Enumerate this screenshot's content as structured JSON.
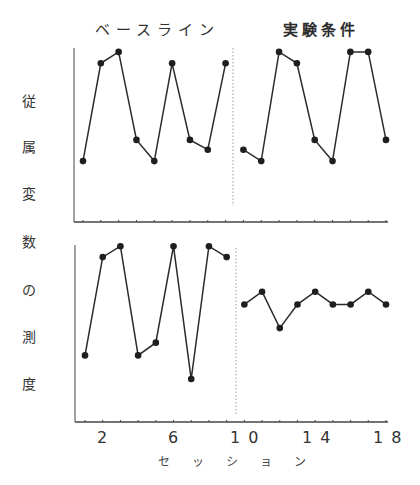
{
  "chart_data": {
    "type": "line",
    "title": "",
    "phases": [
      "ベースライン",
      "実験条件"
    ],
    "xlabel": "セッション",
    "ylabel": "従属変数の測度",
    "xticks": [
      "2",
      "6",
      "10",
      "14",
      "18"
    ],
    "x": [
      1,
      2,
      3,
      4,
      5,
      6,
      7,
      8,
      9,
      10,
      11,
      12,
      13,
      14,
      15,
      16,
      17,
      18
    ],
    "phase_change_after_session": 9,
    "grid": false,
    "ylim": [
      0,
      10
    ],
    "panels": [
      {
        "name": "top",
        "series": [
          {
            "name": "ベースライン",
            "x": [
              1,
              2,
              3,
              4,
              5,
              6,
              7,
              8,
              9
            ],
            "values": [
              3,
              9,
              9.7,
              4.3,
              3,
              9,
              4.3,
              3.7,
              9
            ]
          },
          {
            "name": "実験条件",
            "x": [
              10,
              11,
              12,
              13,
              14,
              15,
              16,
              17,
              18
            ],
            "values": [
              3.7,
              3,
              9.7,
              9,
              4.3,
              3,
              9.7,
              9.7,
              4.3
            ]
          }
        ]
      },
      {
        "name": "bottom",
        "series": [
          {
            "name": "ベースライン",
            "x": [
              1,
              2,
              3,
              4,
              5,
              6,
              7,
              8,
              9
            ],
            "values": [
              3,
              8.4,
              9,
              3,
              3.7,
              9,
              1.7,
              9,
              8.4
            ]
          },
          {
            "name": "実験条件",
            "x": [
              10,
              11,
              12,
              13,
              14,
              15,
              16,
              17,
              18
            ],
            "values": [
              5.8,
              6.5,
              4.5,
              5.8,
              6.5,
              5.8,
              5.8,
              6.5,
              5.8
            ]
          }
        ]
      }
    ]
  },
  "labels": {
    "phase_baseline": "ベースライン",
    "phase_experiment": "実験条件",
    "ylabel_chars": [
      "従",
      "属",
      "変",
      "数",
      "の",
      "測",
      "度"
    ],
    "xtick_2": "2",
    "xtick_6": "6",
    "xtick_10": "10",
    "xtick_14": "14",
    "xtick_18": "18",
    "xlabel": "セッション"
  },
  "colors": {
    "line": "#2b2b2b",
    "marker": "#1e1e1e",
    "axis": "#444444",
    "phase_line": "#9a9a9a"
  }
}
